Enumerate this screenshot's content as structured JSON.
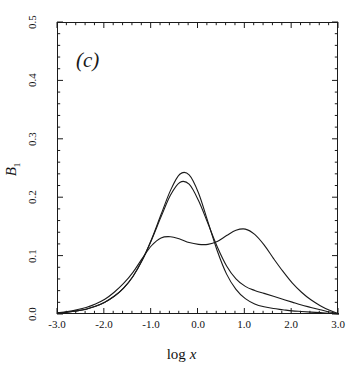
{
  "figure": {
    "panel_label": "(c)",
    "background_color": "#ffffff",
    "line_color": "#1a1a1a"
  },
  "axis": {
    "x_label_prefix": "log ",
    "x_label_var": "x",
    "y_label_var": "B",
    "y_label_sub": "1",
    "x_ticks": [
      "-3.0",
      "-2.0",
      "-1.0",
      "0.0",
      "1.0",
      "2.0",
      "3.0"
    ],
    "y_ticks": [
      "0.5",
      "0.4",
      "0.3",
      "0.2",
      "0.1",
      "0.0"
    ]
  },
  "chart_data": {
    "type": "line",
    "title": "(c)",
    "xlabel": "log x",
    "ylabel": "B_1",
    "xlim": [
      -3.0,
      3.0
    ],
    "ylim": [
      0.0,
      0.5
    ],
    "grid": false,
    "legend": "none",
    "x_major_ticks": [
      -3.0,
      -2.0,
      -1.0,
      0.0,
      1.0,
      2.0,
      3.0
    ],
    "y_major_ticks": [
      0.0,
      0.1,
      0.2,
      0.3,
      0.4,
      0.5
    ],
    "x_minor_tick_interval": 0.2,
    "y_minor_tick_interval": 0.02,
    "tick_direction": "in",
    "x": [
      -3.0,
      -2.8,
      -2.6,
      -2.4,
      -2.2,
      -2.0,
      -1.8,
      -1.6,
      -1.4,
      -1.2,
      -1.0,
      -0.8,
      -0.6,
      -0.4,
      -0.2,
      0.0,
      0.2,
      0.4,
      0.6,
      0.8,
      1.0,
      1.2,
      1.4,
      1.6,
      1.8,
      2.0,
      2.2,
      2.4,
      2.6,
      2.8,
      3.0
    ],
    "series": [
      {
        "name": "curve-1-tall-narrow",
        "peak_value": 0.245,
        "peak_x": -0.45,
        "values": [
          0.003,
          0.005,
          0.007,
          0.01,
          0.015,
          0.022,
          0.032,
          0.046,
          0.066,
          0.094,
          0.13,
          0.172,
          0.213,
          0.241,
          0.24,
          0.209,
          0.16,
          0.11,
          0.07,
          0.044,
          0.028,
          0.019,
          0.014,
          0.011,
          0.009,
          0.007,
          0.006,
          0.005,
          0.004,
          0.003,
          0.002
        ]
      },
      {
        "name": "curve-2-tall-broad-tail",
        "peak_value": 0.229,
        "peak_x": -0.5,
        "values": [
          0.003,
          0.005,
          0.007,
          0.01,
          0.015,
          0.022,
          0.032,
          0.046,
          0.066,
          0.094,
          0.129,
          0.168,
          0.205,
          0.227,
          0.224,
          0.196,
          0.157,
          0.117,
          0.084,
          0.062,
          0.049,
          0.042,
          0.037,
          0.032,
          0.027,
          0.022,
          0.017,
          0.013,
          0.009,
          0.005,
          0.002
        ]
      },
      {
        "name": "curve-3-bimodal",
        "left_peak_value": 0.134,
        "left_peak_x": -0.75,
        "dip_value": 0.121,
        "dip_x": 0.2,
        "right_peak_value": 0.147,
        "right_peak_x": 0.75,
        "values": [
          0.004,
          0.006,
          0.009,
          0.013,
          0.019,
          0.027,
          0.039,
          0.054,
          0.073,
          0.097,
          0.119,
          0.132,
          0.134,
          0.13,
          0.124,
          0.121,
          0.121,
          0.126,
          0.136,
          0.145,
          0.147,
          0.138,
          0.12,
          0.097,
          0.075,
          0.055,
          0.039,
          0.026,
          0.016,
          0.008,
          0.002
        ]
      }
    ]
  }
}
